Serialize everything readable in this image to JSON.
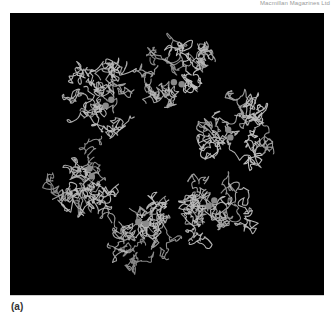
{
  "figure": {
    "credit_text": "Macmillan Magazines Ltd",
    "panel_label": "(a)",
    "image_description": "Ribbon/backbone trace of a hexameric protein complex viewed down its six-fold axis, six subunits surrounding a central channel, each with a pair of bound metal ions",
    "subunit_count": 6,
    "colors": {
      "background": "#000000",
      "trace": "#bdbdbd",
      "metal_ions": "#8a8a8a",
      "page": "#ffffff"
    }
  }
}
